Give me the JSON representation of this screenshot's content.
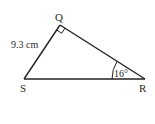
{
  "diagram": {
    "type": "right-triangle",
    "vertices": {
      "Q": {
        "label": "Q",
        "x": 60,
        "y": 25
      },
      "S": {
        "label": "S",
        "x": 24,
        "y": 79
      },
      "R": {
        "label": "R",
        "x": 145,
        "y": 79
      }
    },
    "side_SQ_label": "9.3 cm",
    "angle_R_label": "16°",
    "right_angle_at": "Q",
    "colors": {
      "stroke": "#222222",
      "background": "#ffffff"
    }
  }
}
